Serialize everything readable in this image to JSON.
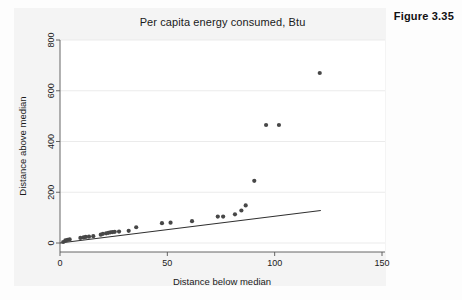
{
  "figure": {
    "label": "Figure 3.35"
  },
  "chart_data": {
    "type": "scatter",
    "title": "Per capita energy consumed, Btu",
    "xlabel": "Distance below median",
    "ylabel": "Distance above median",
    "xlim": [
      0,
      150
    ],
    "ylim": [
      0,
      800
    ],
    "xticks": [
      0,
      50,
      100,
      150
    ],
    "yticks": [
      0,
      200,
      400,
      600,
      800
    ],
    "grid": "horizontal",
    "legend": "none",
    "series": [
      {
        "name": "Quantile pairs",
        "marker": "filled-circle",
        "color": "#474747",
        "points": [
          [
            1.5,
            4
          ],
          [
            2.5,
            10
          ],
          [
            3.5,
            12
          ],
          [
            4.5,
            14
          ],
          [
            9.5,
            20
          ],
          [
            11.0,
            22
          ],
          [
            12.0,
            24
          ],
          [
            13.5,
            25
          ],
          [
            15.5,
            27
          ],
          [
            19.0,
            33
          ],
          [
            20.0,
            36
          ],
          [
            21.5,
            38
          ],
          [
            22.5,
            40
          ],
          [
            23.5,
            42
          ],
          [
            24.5,
            43
          ],
          [
            25.5,
            44
          ],
          [
            27.5,
            45
          ],
          [
            32.0,
            48
          ],
          [
            35.5,
            62
          ],
          [
            47.5,
            78
          ],
          [
            51.5,
            80
          ],
          [
            61.5,
            86
          ],
          [
            73.5,
            104
          ],
          [
            76.0,
            104
          ],
          [
            81.5,
            113
          ],
          [
            84.5,
            128
          ],
          [
            86.5,
            148
          ],
          [
            90.5,
            245
          ],
          [
            96.0,
            465
          ],
          [
            102.0,
            465
          ],
          [
            121.0,
            670
          ]
        ]
      },
      {
        "name": "Reference line",
        "marker": "line",
        "color": "#303030",
        "points": [
          [
            0,
            0
          ],
          [
            121.5,
            128
          ]
        ]
      }
    ]
  }
}
